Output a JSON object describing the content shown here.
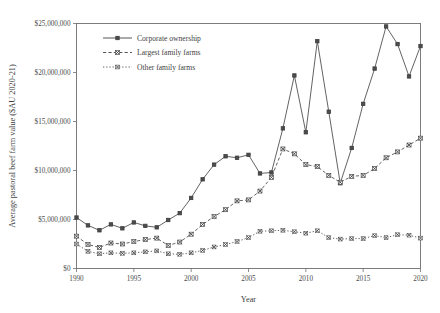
{
  "chart_data": {
    "type": "line",
    "title": "",
    "xlabel": "Year",
    "ylabel": "Average pastoral beef farm value ($AU 2020-21)",
    "xlim": [
      1990,
      2020
    ],
    "ylim": [
      0,
      25000000
    ],
    "grid": false,
    "legend_position": "top-left-inside",
    "x_tick_labels": [
      "1990",
      "1995",
      "2000",
      "2005",
      "2010",
      "2015",
      "2020"
    ],
    "x_tick_values": [
      1990,
      1995,
      2000,
      2005,
      2010,
      2015,
      2020
    ],
    "y_tick_labels": [
      "$0",
      "$5,000,000",
      "$10,000,000",
      "$15,000,000",
      "$20,000,000",
      "$25,000,000"
    ],
    "y_tick_values": [
      0,
      5000000,
      10000000,
      15000000,
      20000000,
      25000000
    ],
    "x": [
      1990,
      1991,
      1992,
      1993,
      1994,
      1995,
      1996,
      1997,
      1998,
      1999,
      2000,
      2001,
      2002,
      2003,
      2004,
      2005,
      2006,
      2007,
      2008,
      2009,
      2010,
      2011,
      2012,
      2013,
      2014,
      2015,
      2016,
      2017,
      2018,
      2019,
      2020
    ],
    "series": [
      {
        "name": "Corporate ownership",
        "marker": "square",
        "linestyle": "solid",
        "color": "#4d4d4d",
        "values": [
          5200000,
          4400000,
          3900000,
          4500000,
          4100000,
          4700000,
          4350000,
          4200000,
          4950000,
          5650000,
          7200000,
          9100000,
          10600000,
          11450000,
          11300000,
          11600000,
          9700000,
          9800000,
          14300000,
          19700000,
          13900000,
          23200000,
          16000000,
          8700000,
          12300000,
          16800000,
          20400000,
          24700000,
          22900000,
          19600000,
          22700000
        ]
      },
      {
        "name": "Largest family farms",
        "marker": "x-square",
        "linestyle": "dashed",
        "color": "#4d4d4d",
        "values": [
          3300000,
          2450000,
          2150000,
          2600000,
          2500000,
          2750000,
          2950000,
          3100000,
          2350000,
          2700000,
          3500000,
          4500000,
          5300000,
          6000000,
          6900000,
          7000000,
          7900000,
          9300000,
          12200000,
          11700000,
          10600000,
          10400000,
          9500000,
          8800000,
          9400000,
          9500000,
          10200000,
          11300000,
          11900000,
          12600000,
          13300000
        ]
      },
      {
        "name": "Other family farms",
        "marker": "x-dot",
        "linestyle": "dotted",
        "color": "#5a5a5a",
        "values": [
          2500000,
          1750000,
          1500000,
          1600000,
          1550000,
          1600000,
          1700000,
          1800000,
          1500000,
          1450000,
          1600000,
          1850000,
          2200000,
          2450000,
          2750000,
          3150000,
          3800000,
          3850000,
          3900000,
          3750000,
          3600000,
          3850000,
          3150000,
          3000000,
          3050000,
          3050000,
          3350000,
          3150000,
          3450000,
          3400000,
          3100000
        ]
      }
    ]
  },
  "legend": {
    "entries": [
      {
        "label": "Corporate ownership"
      },
      {
        "label": "Largest family farms"
      },
      {
        "label": "Other family farms"
      }
    ]
  }
}
